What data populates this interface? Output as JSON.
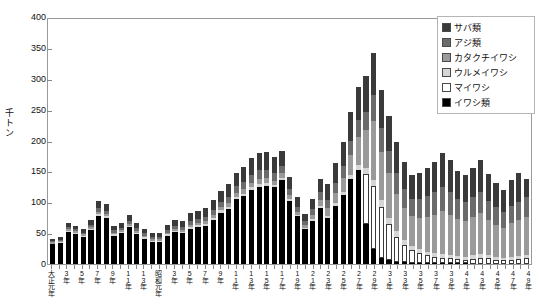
{
  "chart_data": {
    "type": "bar",
    "title": "",
    "subtitle": "",
    "xlabel": "",
    "ylabel": "千トン",
    "ylim": [
      0,
      400
    ],
    "ytick_step": 50,
    "yticks": [
      "0",
      "50",
      "100",
      "150",
      "200",
      "250",
      "300",
      "350",
      "400"
    ],
    "grid": false,
    "stacked": true,
    "legend_position": "top-right",
    "legend_entries": [
      "サバ類",
      "アジ類",
      "カタクチイワシ",
      "ウルメイワシ",
      "マイワシ",
      "イワシ類"
    ],
    "series_colors": [
      "#3a3a3a",
      "#6b6b6b",
      "#9a9a9a",
      "#d6d6d6",
      "#ffffff",
      "#000000"
    ],
    "categories": [
      "大正元年",
      "2年",
      "3年",
      "4年",
      "5年",
      "6年",
      "7年",
      "8年",
      "9年",
      "10年",
      "11年",
      "12年",
      "13年",
      "14年",
      "昭和元年",
      "2年",
      "3年",
      "4年",
      "5年",
      "6年",
      "7年",
      "8年",
      "9年",
      "10年",
      "11年",
      "12年",
      "13年",
      "14年",
      "15年",
      "16年",
      "17年",
      "18年",
      "19年",
      "20年",
      "21年",
      "22年",
      "23年",
      "24年",
      "25年",
      "26年",
      "27年",
      "28年",
      "29年",
      "30年",
      "31年",
      "32年",
      "33年",
      "34年",
      "35年",
      "36年",
      "37年",
      "38年",
      "39年",
      "40年",
      "41年",
      "42年",
      "43年",
      "44年",
      "45年",
      "46年",
      "47年",
      "48年",
      "49年"
    ],
    "xtick_labels_visible": [
      "大正元年",
      "3年",
      "5年",
      "7年",
      "9年",
      "11年",
      "13年",
      "昭和元年",
      "3年",
      "5年",
      "7年",
      "9年",
      "11年",
      "13年",
      "15年",
      "17年",
      "19年",
      "21年",
      "23年",
      "25年",
      "27年",
      "29年",
      "31年",
      "33年",
      "35年",
      "37年",
      "39年",
      "41年",
      "43年",
      "45年",
      "47年",
      "49年"
    ],
    "series": [
      {
        "name": "イワシ類",
        "color": "#000000",
        "values": [
          32,
          34,
          52,
          48,
          43,
          55,
          78,
          74,
          46,
          50,
          60,
          49,
          41,
          36,
          36,
          46,
          52,
          50,
          57,
          60,
          62,
          72,
          83,
          89,
          105,
          110,
          120,
          125,
          126,
          124,
          136,
          102,
          77,
          57,
          70,
          90,
          74,
          94,
          111,
          137,
          152,
          64,
          24,
          10,
          6,
          4,
          3,
          2,
          2,
          1,
          1,
          1,
          1,
          1,
          1,
          0,
          0,
          0,
          0,
          0,
          0,
          0,
          0
        ]
      },
      {
        "name": "マイワシ",
        "color": "#ffffff",
        "values": [
          0,
          0,
          0,
          0,
          0,
          0,
          0,
          0,
          0,
          0,
          0,
          0,
          0,
          0,
          0,
          0,
          0,
          0,
          0,
          0,
          0,
          0,
          0,
          0,
          0,
          0,
          0,
          0,
          0,
          0,
          0,
          0,
          0,
          0,
          0,
          0,
          0,
          0,
          0,
          0,
          0,
          82,
          102,
          83,
          59,
          40,
          28,
          20,
          16,
          13,
          11,
          9,
          8,
          7,
          6,
          8,
          10,
          9,
          7,
          6,
          7,
          8,
          9
        ]
      },
      {
        "name": "ウルメイワシ",
        "color": "#d6d6d6",
        "values": [
          1,
          1,
          2,
          2,
          2,
          2,
          3,
          3,
          2,
          2,
          2,
          2,
          2,
          2,
          2,
          2,
          2,
          2,
          3,
          3,
          3,
          3,
          4,
          4,
          4,
          4,
          5,
          5,
          5,
          4,
          4,
          3,
          3,
          2,
          3,
          4,
          4,
          5,
          6,
          7,
          8,
          9,
          10,
          11,
          10,
          9,
          8,
          7,
          7,
          6,
          6,
          6,
          5,
          5,
          5,
          6,
          6,
          5,
          5,
          4,
          5,
          5,
          5
        ]
      },
      {
        "name": "カタクチイワシ",
        "color": "#9a9a9a",
        "values": [
          2,
          2,
          3,
          3,
          3,
          3,
          4,
          4,
          3,
          3,
          3,
          3,
          3,
          3,
          3,
          3,
          3,
          3,
          4,
          4,
          4,
          5,
          5,
          6,
          6,
          7,
          7,
          8,
          8,
          7,
          7,
          6,
          5,
          4,
          7,
          10,
          12,
          16,
          22,
          32,
          45,
          62,
          96,
          78,
          72,
          60,
          52,
          48,
          50,
          56,
          62,
          70,
          66,
          60,
          58,
          62,
          66,
          58,
          52,
          48,
          54,
          58,
          62
        ]
      },
      {
        "name": "アジ類",
        "color": "#6b6b6b",
        "values": [
          2,
          2,
          3,
          3,
          3,
          4,
          5,
          5,
          4,
          4,
          5,
          4,
          4,
          3,
          3,
          4,
          5,
          5,
          6,
          6,
          7,
          8,
          9,
          10,
          11,
          12,
          13,
          14,
          14,
          13,
          12,
          10,
          8,
          6,
          9,
          12,
          14,
          17,
          20,
          24,
          28,
          30,
          42,
          38,
          36,
          34,
          30,
          28,
          30,
          34,
          36,
          38,
          36,
          32,
          30,
          32,
          34,
          30,
          28,
          26,
          28,
          30,
          32
        ]
      },
      {
        "name": "サバ類",
        "color": "#3a3a3a",
        "values": [
          3,
          4,
          7,
          6,
          5,
          8,
          12,
          11,
          7,
          8,
          10,
          8,
          7,
          6,
          6,
          8,
          10,
          10,
          12,
          13,
          14,
          16,
          18,
          20,
          22,
          24,
          26,
          28,
          28,
          26,
          24,
          20,
          16,
          12,
          16,
          22,
          26,
          32,
          38,
          46,
          54,
          58,
          68,
          62,
          56,
          50,
          44,
          40,
          42,
          46,
          50,
          56,
          52,
          46,
          44,
          48,
          52,
          44,
          40,
          36,
          42,
          46,
          30
        ]
      }
    ]
  },
  "legend": {
    "items": [
      {
        "label": "サバ類",
        "color": "#3a3a3a"
      },
      {
        "label": "アジ類",
        "color": "#6b6b6b"
      },
      {
        "label": "カタクチイワシ",
        "color": "#9a9a9a"
      },
      {
        "label": "ウルメイワシ",
        "color": "#d6d6d6"
      },
      {
        "label": "マイワシ",
        "color": "#ffffff"
      },
      {
        "label": "イワシ類",
        "color": "#000000"
      }
    ]
  },
  "axes": {
    "y_title": "千トン",
    "y_max": 400,
    "y_min": 0
  }
}
